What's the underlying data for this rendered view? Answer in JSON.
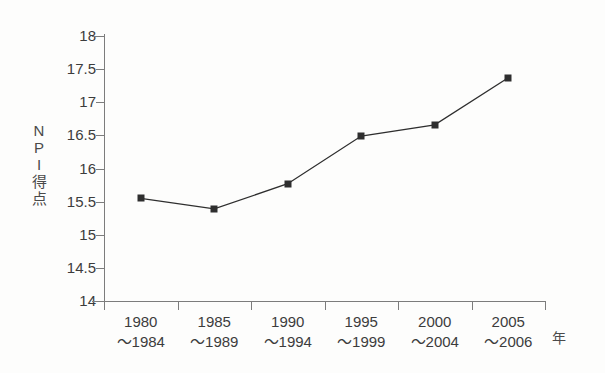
{
  "chart_data": {
    "type": "line",
    "title": "",
    "xlabel": "年",
    "ylabel": "NPI得点",
    "ylabel_chars": [
      "N",
      "P",
      "I",
      "得",
      "点"
    ],
    "categories": [
      "1980\n～1984",
      "1985\n～1989",
      "1990\n～1994",
      "1995\n～1999",
      "2000\n～2004",
      "2005\n～2006"
    ],
    "category_lines": [
      {
        "line1": "1980",
        "line2": "～1984"
      },
      {
        "line1": "1985",
        "line2": "～1989"
      },
      {
        "line1": "1990",
        "line2": "～1994"
      },
      {
        "line1": "1995",
        "line2": "～1999"
      },
      {
        "line1": "2000",
        "line2": "～2004"
      },
      {
        "line1": "2005",
        "line2": "～2006"
      }
    ],
    "values": [
      15.55,
      15.39,
      15.77,
      16.49,
      16.66,
      17.37
    ],
    "ylim": [
      14,
      18
    ],
    "yticks": [
      14,
      14.5,
      15,
      15.5,
      16,
      16.5,
      17,
      17.5,
      18
    ],
    "ytick_labels": [
      "14",
      "14.5",
      "15",
      "15.5",
      "16",
      "16.5",
      "17",
      "17.5",
      "18"
    ],
    "grid": false,
    "legend": false,
    "marker": "square",
    "line_color": "#2e2e2e",
    "marker_color": "#2e2e2e",
    "axis_color": "#7c7c7c",
    "background_color": "#fdfdfc"
  }
}
